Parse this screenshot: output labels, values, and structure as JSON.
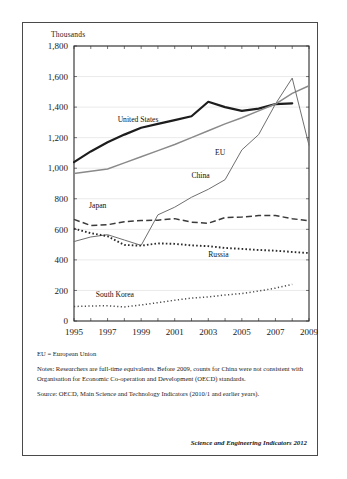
{
  "figure": {
    "units_label": "Thousands",
    "credit": "Science and Engineering Indicators 2012",
    "notes": [
      "EU = European Union",
      "Notes: Researchers are full-time equivalents. Before 2009, counts for China were not consistent with Organisation for Economic Co-operation and Development (OECD) standards.",
      "Source: OECD, Main Science and Technology Indicators (2010/1 and earlier years)."
    ]
  },
  "chart_data": {
    "type": "line",
    "title": "",
    "xlabel": "",
    "ylabel": "Thousands",
    "xlim": [
      1995,
      2009
    ],
    "ylim": [
      0,
      1800
    ],
    "grid": true,
    "legend": "inline-labels",
    "yticks": [
      "0",
      "200",
      "400",
      "600",
      "800",
      "1,000",
      "1,200",
      "1,400",
      "1,600",
      "1,800"
    ],
    "ytick_values": [
      0,
      200,
      400,
      600,
      800,
      1000,
      1200,
      1400,
      1600,
      1800
    ],
    "xticks": [
      "1995",
      "1997",
      "1999",
      "2001",
      "2003",
      "2005",
      "2007",
      "2009"
    ],
    "xtick_values": [
      1995,
      1997,
      1999,
      2001,
      2003,
      2005,
      2007,
      2009
    ],
    "x": [
      1995,
      1996,
      1997,
      1998,
      1999,
      2000,
      2001,
      2002,
      2003,
      2004,
      2005,
      2006,
      2007,
      2008,
      2009
    ],
    "series": [
      {
        "name": "United States",
        "style": "solid-bold",
        "color": "#1d1d1d",
        "values": [
          1040,
          1110,
          1170,
          1220,
          1265,
          1290,
          1315,
          1340,
          1435,
          1400,
          1375,
          1390,
          1420,
          1425,
          null
        ]
      },
      {
        "name": "EU",
        "style": "solid-gray",
        "color": "#8a8a8a",
        "values": [
          965,
          980,
          995,
          1035,
          1075,
          1115,
          1155,
          1200,
          1245,
          1290,
          1330,
          1375,
          1420,
          1490,
          1540
        ]
      },
      {
        "name": "China",
        "style": "solid-thin",
        "color": "#6f6f6f",
        "values": [
          520,
          550,
          565,
          530,
          495,
          695,
          745,
          810,
          862,
          925,
          1120,
          1220,
          1420,
          1590,
          1150
        ]
      },
      {
        "name": "Japan",
        "style": "long-dash",
        "color": "#3a3a3a",
        "values": [
          665,
          625,
          630,
          650,
          658,
          660,
          670,
          647,
          640,
          677,
          680,
          690,
          690,
          670,
          655
        ]
      },
      {
        "name": "Russia",
        "style": "square-dot",
        "color": "#2a2a2a",
        "values": [
          605,
          575,
          555,
          498,
          493,
          508,
          505,
          495,
          490,
          478,
          472,
          465,
          460,
          452,
          445
        ]
      },
      {
        "name": "South Korea",
        "style": "fine-dot",
        "color": "#4a4a4a",
        "values": [
          95,
          98,
          100,
          92,
          105,
          120,
          136,
          150,
          158,
          170,
          180,
          196,
          215,
          240,
          null
        ]
      }
    ]
  }
}
